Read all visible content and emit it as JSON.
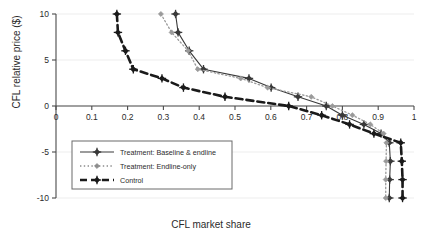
{
  "figure": {
    "kind": "scatter-line-figure",
    "background": "#ffffff"
  },
  "axes": {
    "x_title": "CFL market share",
    "y_title": "CFL relative price ($)",
    "x_ticks": [
      "0",
      "0.1",
      "0.2",
      "0.3",
      "0.4",
      "0.5",
      "0.6",
      "0.7",
      "0.8",
      "0.9",
      "1"
    ],
    "y_ticks": [
      "10",
      "5",
      "0",
      "-5",
      "-10"
    ]
  },
  "legend": {
    "items": [
      {
        "label": "Treatment: Baseline & endline",
        "style": "solid-marker",
        "color": "#3a3a3a"
      },
      {
        "label": "Treatment: Endline-only",
        "style": "dotted-marker",
        "color": "#8c8c8c"
      },
      {
        "label": "Control",
        "style": "thick-dashed-marker",
        "color": "#1a1a1a"
      }
    ]
  },
  "chart_data": {
    "type": "line",
    "title": "",
    "xlabel": "CFL market share",
    "ylabel": "CFL relative price ($)",
    "xlim": [
      0,
      1
    ],
    "ylim": [
      -10,
      10
    ],
    "xticks": [
      0,
      0.1,
      0.2,
      0.3,
      0.4,
      0.5,
      0.6,
      0.7,
      0.8,
      0.9,
      1
    ],
    "yticks": [
      10,
      5,
      0,
      -5,
      -10
    ],
    "grid": "horizontal-light",
    "legend_position": "lower-left-inside",
    "orientation": "price-on-y-share-on-x",
    "series": [
      {
        "name": "Treatment: Baseline & endline",
        "color": "#3a3a3a",
        "line": "solid",
        "marker": "plus-diamond",
        "points": [
          {
            "price": 10,
            "share": 0.334
          },
          {
            "price": 8,
            "share": 0.341
          },
          {
            "price": 6,
            "share": 0.372
          },
          {
            "price": 4,
            "share": 0.412
          },
          {
            "price": 3,
            "share": 0.539
          },
          {
            "price": 2,
            "share": 0.601
          },
          {
            "price": 1,
            "share": 0.676
          },
          {
            "price": 0,
            "share": 0.755
          },
          {
            "price": -1,
            "share": 0.8
          },
          {
            "price": -2,
            "share": 0.86
          },
          {
            "price": -3,
            "share": 0.908
          },
          {
            "price": -4,
            "share": 0.931
          },
          {
            "price": -6,
            "share": 0.934
          },
          {
            "price": -8,
            "share": 0.932
          },
          {
            "price": -10,
            "share": 0.931
          }
        ]
      },
      {
        "name": "Treatment: Endline-only",
        "color": "#9a9a9a",
        "line": "dotted",
        "marker": "diamond",
        "points": [
          {
            "price": 10,
            "share": 0.293
          },
          {
            "price": 8,
            "share": 0.323
          },
          {
            "price": 6,
            "share": 0.369
          },
          {
            "price": 4,
            "share": 0.396
          },
          {
            "price": 3,
            "share": 0.516
          },
          {
            "price": 2,
            "share": 0.591
          },
          {
            "price": 1,
            "share": 0.713
          },
          {
            "price": 0,
            "share": 0.772
          },
          {
            "price": -1,
            "share": 0.828
          },
          {
            "price": -2,
            "share": 0.878
          },
          {
            "price": -3,
            "share": 0.915
          },
          {
            "price": -4,
            "share": 0.923
          },
          {
            "price": -6,
            "share": 0.922
          },
          {
            "price": -8,
            "share": 0.921
          },
          {
            "price": -10,
            "share": 0.921
          }
        ]
      },
      {
        "name": "Control",
        "color": "#1a1a1a",
        "line": "thick-dashed",
        "marker": "plus-diamond",
        "points": [
          {
            "price": 10,
            "share": 0.17
          },
          {
            "price": 8,
            "share": 0.173
          },
          {
            "price": 6,
            "share": 0.194
          },
          {
            "price": 4,
            "share": 0.216
          },
          {
            "price": 3,
            "share": 0.296
          },
          {
            "price": 2,
            "share": 0.356
          },
          {
            "price": 1,
            "share": 0.472
          },
          {
            "price": 0,
            "share": 0.65
          },
          {
            "price": -1,
            "share": 0.742
          },
          {
            "price": -2,
            "share": 0.82
          },
          {
            "price": -3,
            "share": 0.888
          },
          {
            "price": -4,
            "share": 0.963
          },
          {
            "price": -6,
            "share": 0.966
          },
          {
            "price": -8,
            "share": 0.968
          },
          {
            "price": -10,
            "share": 0.968
          }
        ]
      }
    ]
  }
}
